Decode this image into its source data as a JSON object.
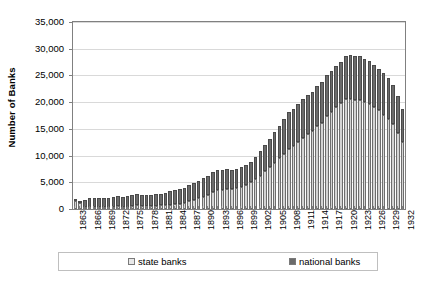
{
  "chart_data": {
    "type": "bar",
    "subtype": "stacked-column",
    "title": "",
    "xlabel": "",
    "ylabel": "Number of Banks",
    "ylim": [
      0,
      35000
    ],
    "ytick_values": [
      0,
      5000,
      10000,
      15000,
      20000,
      25000,
      30000,
      35000
    ],
    "ytick_labels": [
      "0",
      "5,000",
      "10,000",
      "15,000",
      "20,000",
      "25,000",
      "30,000",
      "35,000"
    ],
    "grid": true,
    "legend_position": "bottom",
    "legend": [
      "state banks",
      "national banks"
    ],
    "xtick_labels": [
      "1863",
      "1866",
      "1869",
      "1872",
      "1875",
      "1878",
      "1881",
      "1884",
      "1887",
      "1890",
      "1893",
      "1896",
      "1899",
      "1902",
      "1905",
      "1908",
      "1911",
      "1914",
      "1917",
      "1920",
      "1923",
      "1926",
      "1929",
      "1932"
    ],
    "xtick_step": 3,
    "categories": [
      "1863",
      "1864",
      "1865",
      "1866",
      "1867",
      "1868",
      "1869",
      "1870",
      "1871",
      "1872",
      "1873",
      "1874",
      "1875",
      "1876",
      "1877",
      "1878",
      "1879",
      "1880",
      "1881",
      "1882",
      "1883",
      "1884",
      "1885",
      "1886",
      "1887",
      "1888",
      "1889",
      "1890",
      "1891",
      "1892",
      "1893",
      "1894",
      "1895",
      "1896",
      "1897",
      "1898",
      "1899",
      "1900",
      "1901",
      "1902",
      "1903",
      "1904",
      "1905",
      "1906",
      "1907",
      "1908",
      "1909",
      "1910",
      "1911",
      "1912",
      "1913",
      "1914",
      "1915",
      "1916",
      "1917",
      "1918",
      "1919",
      "1920",
      "1921",
      "1922",
      "1923",
      "1924",
      "1925",
      "1926",
      "1927",
      "1928",
      "1929",
      "1930",
      "1931",
      "1932"
    ],
    "series": [
      {
        "name": "state banks",
        "color": "#d4d4d4",
        "values": [
          1466,
          1089,
          349,
          297,
          272,
          247,
          259,
          325,
          452,
          566,
          277,
          368,
          586,
          671,
          631,
          510,
          648,
          650,
          683,
          704,
          788,
          852,
          1015,
          1118,
          1471,
          1720,
          2038,
          2250,
          2572,
          3191,
          3579,
          3586,
          3774,
          3708,
          3857,
          4191,
          4572,
          5007,
          5651,
          6266,
          7132,
          7835,
          8696,
          9546,
          10382,
          11291,
          11837,
          12554,
          13383,
          14011,
          14512,
          15526,
          16172,
          17498,
          18227,
          19061,
          19785,
          20639,
          20618,
          20355,
          20424,
          20076,
          19631,
          19032,
          18462,
          17690,
          16933,
          15893,
          14309,
          12529
        ]
      },
      {
        "name": "national banks",
        "color": "#6b6b6b",
        "values": [
          66,
          467,
          1294,
          1634,
          1636,
          1640,
          1619,
          1615,
          1767,
          1853,
          1968,
          2027,
          2076,
          2091,
          2078,
          2056,
          2048,
          2076,
          2132,
          2269,
          2501,
          2664,
          2714,
          2809,
          3014,
          3120,
          3239,
          3484,
          3652,
          3759,
          3807,
          3770,
          3715,
          3689,
          3610,
          3582,
          3583,
          3732,
          4165,
          4535,
          4939,
          5331,
          5664,
          6053,
          6429,
          6824,
          6926,
          7145,
          7277,
          7372,
          7473,
          7518,
          7605,
          7571,
          7599,
          7699,
          7779,
          8024,
          8150,
          8246,
          8236,
          8085,
          8066,
          7978,
          7790,
          7685,
          7530,
          7247,
          6800,
          6145
        ]
      }
    ]
  }
}
